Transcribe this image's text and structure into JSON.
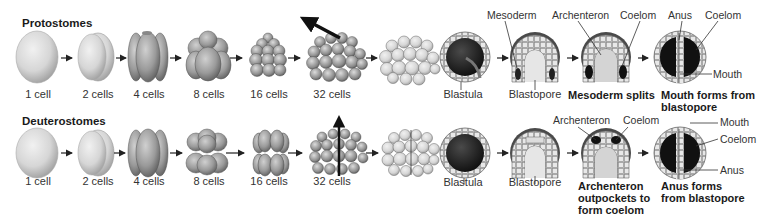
{
  "rows": [
    {
      "title": "Protostomes",
      "cleavage": [
        "1 cell",
        "2 cells",
        "4 cells",
        "8 cells",
        "16 cells",
        "32 cells"
      ],
      "stages": {
        "blastula": "Blastula",
        "gastrula": "Blastopore",
        "third": "Mesoderm splits",
        "fourth_line1": "Mouth forms from",
        "fourth_line2": "blastopore"
      },
      "labels": {
        "mesoderm": "Mesoderm",
        "archenteron": "Archenteron",
        "coelom": "Coelom",
        "anus": "Anus",
        "coelom2": "Coelom",
        "mouth": "Mouth"
      }
    },
    {
      "title": "Deuterostomes",
      "cleavage": [
        "1 cell",
        "2 cells",
        "4 cells",
        "8 cells",
        "16 cells",
        "32 cells"
      ],
      "stages": {
        "blastula": "Blastula",
        "gastrula": "Blastopore",
        "third_line1": "Archenteron",
        "third_line2": "outpockets to",
        "third_line3": "form coelom",
        "fourth_line1": "Anus forms",
        "fourth_line2": "from blastopore"
      },
      "labels": {
        "archenteron": "Archenteron",
        "coelom": "Coelom",
        "mouth": "Mouth",
        "coelom2": "Coelom",
        "anus": "Anus"
      }
    }
  ]
}
